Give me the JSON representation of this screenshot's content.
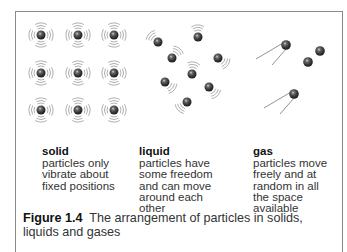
{
  "figure": {
    "label": "Figure 1.4",
    "caption": "The arrangement of particles in solids, liquids and gases"
  },
  "states": [
    {
      "title": "solid",
      "desc": "particles only\nvibrate about\nfixed positions"
    },
    {
      "title": "liquid",
      "desc": "particles have\nsome freedom\nand can move\naround each\nother"
    },
    {
      "title": "gas",
      "desc": "particles move\nfreely and at\nrandom in all\nthe space\navailable"
    }
  ],
  "colors": {
    "particle": "#3a3a3a",
    "highlight": "#e8e8e8",
    "vibration": "#9a9a9a",
    "frame": "#8a8a8a"
  },
  "particles": {
    "solid": [
      [
        41,
        35
      ],
      [
        78,
        35
      ],
      [
        114,
        35
      ],
      [
        41,
        73
      ],
      [
        78,
        73
      ],
      [
        114,
        73
      ],
      [
        41,
        110
      ],
      [
        78,
        110
      ],
      [
        114,
        110
      ]
    ],
    "liquid": [
      [
        158,
        42
      ],
      [
        198,
        37
      ],
      [
        172,
        58
      ],
      [
        218,
        58
      ],
      [
        192,
        74
      ],
      [
        165,
        82
      ],
      [
        209,
        87
      ],
      [
        187,
        102
      ]
    ],
    "gas": [
      [
        286,
        45
      ],
      [
        320,
        51
      ],
      [
        308,
        62
      ],
      [
        294,
        94
      ]
    ]
  }
}
